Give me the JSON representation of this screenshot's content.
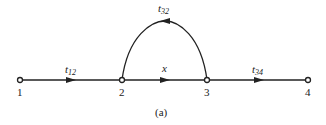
{
  "diagram": {
    "caption": "(a)",
    "nodes": [
      {
        "id": "1",
        "label": "1",
        "x": 20,
        "y": 80
      },
      {
        "id": "2",
        "label": "2",
        "x": 122,
        "y": 80
      },
      {
        "id": "3",
        "label": "3",
        "x": 207,
        "y": 80
      },
      {
        "id": "4",
        "label": "4",
        "x": 308,
        "y": 80
      }
    ],
    "edges": [
      {
        "from": "1",
        "to": "2",
        "label_main": "t",
        "label_sub": "12"
      },
      {
        "from": "2",
        "to": "3",
        "label_main": "x",
        "label_sub": ""
      },
      {
        "from": "3",
        "to": "2",
        "label_main": "t",
        "label_sub": "32",
        "curved": true
      },
      {
        "from": "3",
        "to": "4",
        "label_main": "t",
        "label_sub": "34"
      }
    ],
    "colors": {
      "line": "#222222",
      "background": "#ffffff"
    }
  }
}
